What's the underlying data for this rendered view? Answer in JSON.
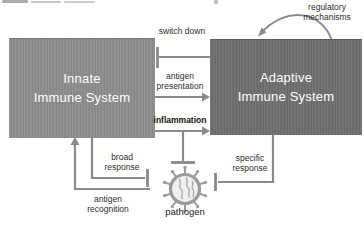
{
  "canvas": {
    "width": 364,
    "height": 229,
    "background": "#ffffff"
  },
  "boxes": {
    "innate": {
      "label": "Innate\nImmune System",
      "fill": "#8d8d8d",
      "text_color": "#ffffff"
    },
    "adaptive": {
      "label": "Adaptive\nImmune System",
      "fill": "#6f6f6f",
      "text_color": "#ffffff"
    }
  },
  "edge_labels": {
    "switch_down": "switch down",
    "antigen_presentation": "antigen presentation",
    "inflammation": "inflammation",
    "broad_response": "broad response",
    "specific_response": "specific response",
    "antigen_recognition": "antigen recognition",
    "regulatory_mechanisms": "regulatory mechanisms"
  },
  "pathogen": {
    "label": "pathogen"
  },
  "relations": [
    {
      "from": "adaptive-immune-system",
      "to": "innate-immune-system",
      "type": "inhibition",
      "label": "switch down"
    },
    {
      "from": "innate-immune-system",
      "to": "adaptive-immune-system",
      "type": "arrow",
      "label": "antigen presentation"
    },
    {
      "from": "innate-immune-system",
      "to": "adaptive-immune-system",
      "type": "arrow",
      "label": "inflammation"
    },
    {
      "from": "inflammation-line",
      "to": "pathogen",
      "type": "inhibition",
      "label": ""
    },
    {
      "from": "innate-immune-system",
      "to": "pathogen",
      "type": "inhibition",
      "label": "broad response"
    },
    {
      "from": "adaptive-immune-system",
      "to": "pathogen",
      "type": "inhibition",
      "label": "specific response"
    },
    {
      "from": "pathogen",
      "to": "innate-immune-system",
      "type": "arrow",
      "label": "antigen recognition"
    },
    {
      "from": "adaptive-immune-system",
      "to": "adaptive-immune-system",
      "type": "self-loop",
      "label": "regulatory mechanisms"
    }
  ],
  "colors": {
    "connector_line": "#8a8a8a",
    "label_text": "#2e2e2e",
    "pathogen_stroke": "#9a9a9a",
    "pathogen_fill": "#f2f0ef"
  }
}
